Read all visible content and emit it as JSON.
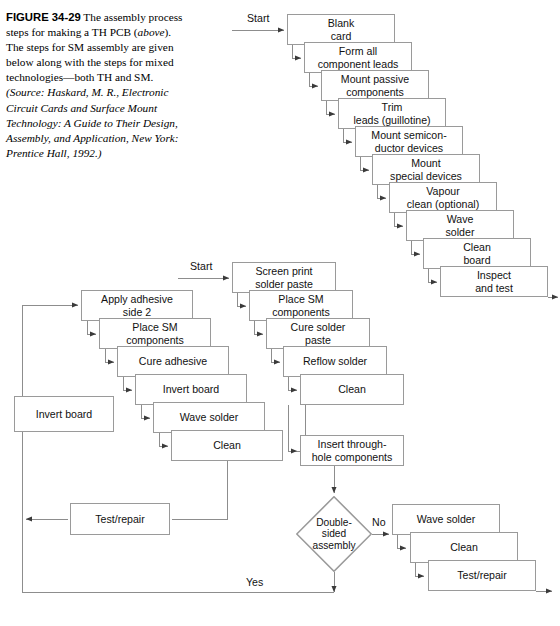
{
  "figure": {
    "label": "FIGURE 34-29",
    "body_1": "The assembly process steps for making a TH PCB (",
    "italic_above": "above",
    "body_2": "). The steps for SM assembly are given below along with the steps for mixed technologies—both TH and SM.",
    "source": "(Source: Haskard, M. R., Electronic Circuit Cards and Surface Mount Technology: A Guide to Their Design, Assembly, and Application, New York: Prentice Hall, 1992.)"
  },
  "labels": {
    "start_th": "Start",
    "start_sm": "Start",
    "no": "No",
    "yes": "Yes"
  },
  "th_chain": [
    {
      "id": "blank-card",
      "text": "Blank\ncard",
      "x": 287,
      "y": 14,
      "w": 108,
      "h": 31
    },
    {
      "id": "form-all-component-leads",
      "text": "Form all\ncomponent leads",
      "x": 304,
      "y": 42,
      "w": 108,
      "h": 31
    },
    {
      "id": "mount-passive-components",
      "text": "Mount passive\ncomponents",
      "x": 321,
      "y": 70,
      "w": 108,
      "h": 31
    },
    {
      "id": "trim-leads-guillotine",
      "text": "Trim\nleads (guillotine)",
      "x": 338,
      "y": 98,
      "w": 108,
      "h": 31
    },
    {
      "id": "mount-semiconductor-devices",
      "text": "Mount semicon-\nductor devices",
      "x": 355,
      "y": 126,
      "w": 108,
      "h": 31
    },
    {
      "id": "mount-special-devices",
      "text": "Mount\nspecial devices",
      "x": 372,
      "y": 154,
      "w": 108,
      "h": 31
    },
    {
      "id": "vapour-clean-optional",
      "text": "Vapour\nclean (optional)",
      "x": 389,
      "y": 182,
      "w": 108,
      "h": 31
    },
    {
      "id": "wave-solder-th",
      "text": "Wave\nsolder",
      "x": 406,
      "y": 210,
      "w": 108,
      "h": 31
    },
    {
      "id": "clean-board",
      "text": "Clean\nboard",
      "x": 423,
      "y": 238,
      "w": 108,
      "h": 31
    },
    {
      "id": "inspect-and-test",
      "text": "Inspect\nand test",
      "x": 440,
      "y": 266,
      "w": 108,
      "h": 31
    }
  ],
  "sm_chain": [
    {
      "id": "apply-adhesive-side-2",
      "text": "Apply adhesive\nside 2",
      "x": 81,
      "y": 290,
      "w": 112,
      "h": 31
    },
    {
      "id": "place-sm-components-left",
      "text": "Place SM\ncomponents",
      "x": 99,
      "y": 318,
      "w": 112,
      "h": 31
    },
    {
      "id": "cure-adhesive",
      "text": "Cure adhesive",
      "x": 117,
      "y": 346,
      "w": 112,
      "h": 31
    },
    {
      "id": "invert-board-chain",
      "text": "Invert board",
      "x": 135,
      "y": 374,
      "w": 112,
      "h": 31
    },
    {
      "id": "wave-solder-sm",
      "text": "Wave solder",
      "x": 153,
      "y": 402,
      "w": 112,
      "h": 31
    },
    {
      "id": "clean-sm",
      "text": "Clean",
      "x": 171,
      "y": 430,
      "w": 112,
      "h": 31
    }
  ],
  "mixed_chain": [
    {
      "id": "screen-print-solder-paste",
      "text": "Screen print\nsolder paste",
      "x": 232,
      "y": 262,
      "w": 104,
      "h": 31
    },
    {
      "id": "place-sm-components-mid",
      "text": "Place SM\ncomponents",
      "x": 249,
      "y": 290,
      "w": 104,
      "h": 31
    },
    {
      "id": "cure-solder-paste",
      "text": "Cure solder\npaste",
      "x": 266,
      "y": 318,
      "w": 104,
      "h": 31
    },
    {
      "id": "reflow-solder",
      "text": "Reflow solder",
      "x": 283,
      "y": 346,
      "w": 104,
      "h": 31
    },
    {
      "id": "clean-mid",
      "text": "Clean",
      "x": 300,
      "y": 374,
      "w": 104,
      "h": 31
    },
    {
      "id": "insert-through-hole-components",
      "text": "Insert through-\nhole components",
      "x": 300,
      "y": 435,
      "w": 104,
      "h": 31
    }
  ],
  "no_branch": [
    {
      "id": "wave-solder-no",
      "text": "Wave solder",
      "x": 392,
      "y": 504,
      "w": 108,
      "h": 31
    },
    {
      "id": "clean-no",
      "text": "Clean",
      "x": 410,
      "y": 532,
      "w": 108,
      "h": 31
    },
    {
      "id": "test-repair-no",
      "text": "Test/repair",
      "x": 428,
      "y": 560,
      "w": 108,
      "h": 31
    }
  ],
  "standalone": [
    {
      "id": "invert-board-left",
      "text": "Invert board",
      "x": 14,
      "y": 396,
      "w": 100,
      "h": 36
    },
    {
      "id": "test-repair-left",
      "text": "Test/repair",
      "x": 70,
      "y": 503,
      "w": 100,
      "h": 32
    }
  ],
  "decision": {
    "id": "double-sided-assembly",
    "text": "Double-\nsided\nassembly",
    "x": 296,
    "y": 496,
    "w": 76,
    "h": 76
  },
  "colors": {
    "box_border": "#9a9a9a",
    "line": "#8d8d8d",
    "text": "#111111",
    "background": "#ffffff"
  }
}
